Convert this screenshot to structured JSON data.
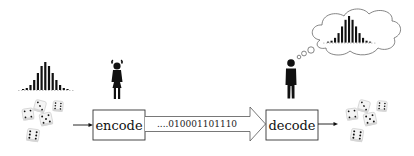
{
  "diagram": {
    "encoder_label": "encode",
    "decoder_label": "decode",
    "channel_bits": "....010001101110",
    "source": {
      "icon": "dice-icon",
      "histogram_icon": "histogram-icon",
      "person_icon": "woman-icon"
    },
    "receiver": {
      "icon": "dice-icon",
      "histogram_icon": "histogram-icon",
      "thought_bubble_icon": "thought-bubble-icon",
      "person_icon": "man-icon"
    },
    "histogram_bars": [
      1,
      2,
      5,
      10,
      17,
      24,
      28,
      24,
      17,
      10,
      5,
      2,
      1
    ],
    "colors": {
      "ink": "#111111",
      "box_border": "#333333",
      "background": "#ffffff"
    }
  }
}
